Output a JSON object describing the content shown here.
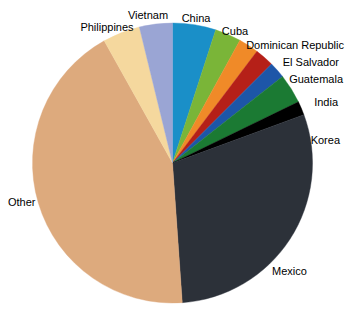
{
  "chart_data": {
    "type": "pie",
    "title": "",
    "subtitle": "",
    "xlabel": "",
    "ylabel": "",
    "legend_position": "none",
    "grid": false,
    "labels_outside": true,
    "start_angle_deg": 0,
    "direction": "clockwise",
    "categories": [
      "China",
      "Cuba",
      "Dominican Republic",
      "El Salvador",
      "Guatemala",
      "India",
      "Korea",
      "Mexico",
      "Other",
      "Philippines",
      "Vietnam"
    ],
    "values": [
      5.0,
      3.0,
      2.3,
      2.2,
      1.9,
      3.4,
      1.6,
      29.5,
      43.0,
      4.3,
      3.8
    ],
    "colors": [
      "#1a8fc8",
      "#7ab538",
      "#f08a28",
      "#b52018",
      "#1d56a8",
      "#1b7a33",
      "#000000",
      "#2c3139",
      "#ddaa7d",
      "#f5d89e",
      "#9aa5d4"
    ],
    "slices": [
      {
        "label": "China",
        "value": 5.0,
        "color": "#1a8fc8",
        "start_deg": 0.0,
        "end_deg": 18.0
      },
      {
        "label": "Cuba",
        "value": 3.0,
        "color": "#7ab538",
        "start_deg": 18.0,
        "end_deg": 28.8
      },
      {
        "label": "Dominican Republic",
        "value": 2.3,
        "color": "#f08a28",
        "start_deg": 28.8,
        "end_deg": 37.1
      },
      {
        "label": "El Salvador",
        "value": 2.2,
        "color": "#b52018",
        "start_deg": 37.1,
        "end_deg": 45.0
      },
      {
        "label": "Guatemala",
        "value": 1.9,
        "color": "#1d56a8",
        "start_deg": 45.0,
        "end_deg": 51.8
      },
      {
        "label": "India",
        "value": 3.4,
        "color": "#1b7a33",
        "start_deg": 51.8,
        "end_deg": 64.1
      },
      {
        "label": "Korea",
        "value": 1.6,
        "color": "#000000",
        "start_deg": 64.1,
        "end_deg": 69.8
      },
      {
        "label": "Mexico",
        "value": 29.5,
        "color": "#2c3139",
        "start_deg": 69.8,
        "end_deg": 176.0
      },
      {
        "label": "Other",
        "value": 43.0,
        "color": "#ddaa7d",
        "start_deg": 176.0,
        "end_deg": 330.8
      },
      {
        "label": "Philippines",
        "value": 4.3,
        "color": "#f5d89e",
        "start_deg": 330.8,
        "end_deg": 346.3
      },
      {
        "label": "Vietnam",
        "value": 3.8,
        "color": "#9aa5d4",
        "start_deg": 346.3,
        "end_deg": 360.0
      }
    ]
  },
  "labels": {
    "china": "China",
    "cuba": "Cuba",
    "dominican_republic": "Dominican Republic",
    "el_salvador": "El Salvador",
    "guatemala": "Guatemala",
    "india": "India",
    "korea": "Korea",
    "mexico": "Mexico",
    "other": "Other",
    "philippines": "Philippines",
    "vietnam": "Vietnam"
  }
}
